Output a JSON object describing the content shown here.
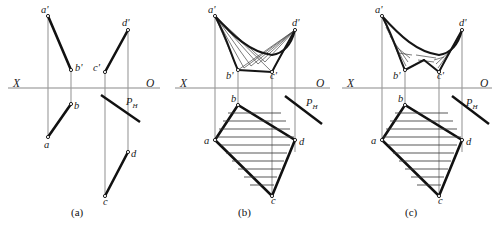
{
  "figure": {
    "colors": {
      "axis": "#8a8a8a",
      "projector": "#9a9a9a",
      "edge": "#111111",
      "hatch": "#3a3a3a",
      "background": "#ffffff"
    }
  },
  "panels": [
    {
      "id": "a",
      "caption": "(a)",
      "axis": {
        "x_label": "X",
        "o_label": "O"
      },
      "trace_label": {
        "base": "P",
        "sub": "H"
      },
      "points": [
        {
          "name": "a-prime",
          "label": "a'"
        },
        {
          "name": "b-prime",
          "label": "b'"
        },
        {
          "name": "c-prime",
          "label": "c'"
        },
        {
          "name": "d-prime",
          "label": "d'"
        },
        {
          "name": "a",
          "label": "a"
        },
        {
          "name": "b",
          "label": "b"
        },
        {
          "name": "c",
          "label": "c"
        },
        {
          "name": "d",
          "label": "d"
        }
      ]
    },
    {
      "id": "b",
      "caption": "(b)",
      "axis": {
        "x_label": "X",
        "o_label": "O"
      },
      "trace_label": {
        "base": "P",
        "sub": "H"
      },
      "points": [
        {
          "name": "a-prime",
          "label": "a'"
        },
        {
          "name": "b-prime",
          "label": "b'"
        },
        {
          "name": "c-prime",
          "label": "c'"
        },
        {
          "name": "d-prime",
          "label": "d'"
        },
        {
          "name": "a",
          "label": "a"
        },
        {
          "name": "b",
          "label": "b"
        },
        {
          "name": "c",
          "label": "c"
        },
        {
          "name": "d",
          "label": "d"
        }
      ]
    },
    {
      "id": "c",
      "caption": "(c)",
      "axis": {
        "x_label": "X",
        "o_label": "O"
      },
      "trace_label": {
        "base": "P",
        "sub": "H"
      },
      "points": [
        {
          "name": "a-prime",
          "label": "a'"
        },
        {
          "name": "b-prime",
          "label": "b'"
        },
        {
          "name": "c-prime",
          "label": "c'"
        },
        {
          "name": "d-prime",
          "label": "d'"
        },
        {
          "name": "a",
          "label": "a"
        },
        {
          "name": "b",
          "label": "b"
        },
        {
          "name": "c",
          "label": "c"
        },
        {
          "name": "d",
          "label": "d"
        }
      ]
    }
  ]
}
